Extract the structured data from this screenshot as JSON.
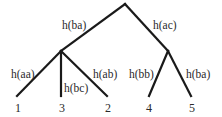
{
  "diagram": {
    "type": "tree",
    "nodes": {
      "root": {
        "x": 125,
        "y": 4
      },
      "left": {
        "x": 61,
        "y": 51
      },
      "right": {
        "x": 168,
        "y": 51
      }
    },
    "edges": [
      {
        "id": "root-left",
        "label": "h(ba)"
      },
      {
        "id": "root-right",
        "label": "h(ac)"
      },
      {
        "id": "left-1",
        "label": "h(aa)"
      },
      {
        "id": "left-3",
        "label": "h(bc)"
      },
      {
        "id": "left-2",
        "label": "h(ab)"
      },
      {
        "id": "right-4",
        "label": "h(bb)"
      },
      {
        "id": "right-5",
        "label": "h(ba)"
      }
    ],
    "leaves": [
      "1",
      "3",
      "2",
      "4",
      "5"
    ]
  }
}
